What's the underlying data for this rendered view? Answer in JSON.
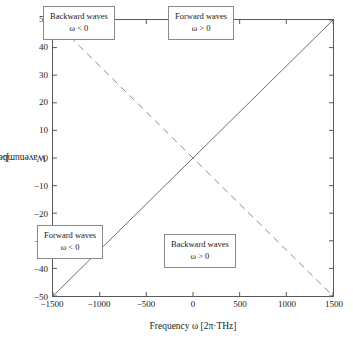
{
  "chart_data": {
    "type": "line",
    "title": "",
    "xlabel": "Frequency ω [2π·THz]",
    "ylabel": "Wavenumber β [μm⁻¹]",
    "xlim": [
      -1500,
      1500
    ],
    "ylim": [
      -50,
      50
    ],
    "xticks": [
      -1500,
      -1000,
      -500,
      0,
      500,
      1000,
      1500
    ],
    "yticks": [
      50,
      40,
      30,
      20,
      10,
      0,
      -10,
      -20,
      -30,
      -40,
      -50
    ],
    "xtick_labels": [
      "−1500",
      "−1000",
      "−500",
      "0",
      "500",
      "1000",
      "1500"
    ],
    "ytick_labels": [
      "50",
      "40",
      "30",
      "20",
      "10",
      "0",
      "−10",
      "−20",
      "−30",
      "−40",
      "−50"
    ],
    "grid": false,
    "legend": "none",
    "series": [
      {
        "name": "forward-branch",
        "style": "solid",
        "color": "#6e6e6e",
        "x": [
          -1500,
          1500
        ],
        "values": [
          -50,
          50
        ]
      },
      {
        "name": "backward-branch",
        "style": "dashed",
        "color": "#8c8c8c",
        "x": [
          -1500,
          1500
        ],
        "values": [
          50,
          -50
        ]
      }
    ],
    "annotations": [
      {
        "id": "top-left",
        "line1": "Backward waves",
        "line2": "ω < 0",
        "quadrant": "upper-left"
      },
      {
        "id": "top-right",
        "line1": "Forward waves",
        "line2": "ω > 0",
        "quadrant": "upper-right"
      },
      {
        "id": "bottom-left",
        "line1": "Forward waves",
        "line2": "ω < 0",
        "quadrant": "lower-left"
      },
      {
        "id": "bottom-right",
        "line1": "Backward waves",
        "line2": "ω > 0",
        "quadrant": "lower-right"
      }
    ]
  },
  "axes": {
    "x_title": "Frequency ω [2π·THz]",
    "y_title_prefix": "Wavenumber β [μm",
    "y_title_exponent": "−1",
    "y_title_suffix": "]"
  },
  "colors": {
    "frame": "#595959",
    "solid_line": "#6e6e6e",
    "dashed_line": "#8c8c8c",
    "box_border": "#8a8a8a",
    "text": "#1a1a1a",
    "background": "#ffffff"
  }
}
